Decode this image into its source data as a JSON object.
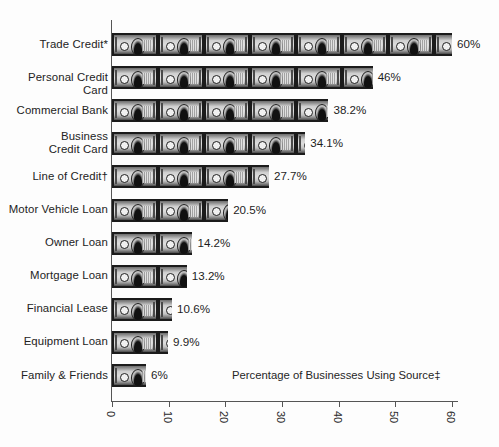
{
  "chart_data": {
    "type": "bar",
    "orientation": "horizontal",
    "title": "",
    "xlabel": "Percentage of Businesses Using Source‡",
    "ylabel": "",
    "xlim": [
      0,
      60
    ],
    "xticks": [
      "0",
      "10",
      "20",
      "30",
      "40",
      "50",
      "60"
    ],
    "grid": false,
    "legend": null,
    "pictogram_unit": "dollar-bill",
    "categories": [
      "Trade Credit*",
      "Personal Credit Card",
      "Commercial Bank",
      "Business\nCredit Card",
      "Line of Credit†",
      "Motor Vehicle Loan",
      "Owner Loan",
      "Mortgage Loan",
      "Financial Lease",
      "Equipment Loan",
      "Family & Friends"
    ],
    "values": [
      60,
      46,
      38.2,
      34.1,
      27.7,
      20.5,
      14.2,
      13.2,
      10.6,
      9.9,
      6
    ],
    "value_labels": [
      "60%",
      "46%",
      "38.2%",
      "34.1%",
      "27.7%",
      "20.5%",
      "14.2%",
      "13.2%",
      "10.6%",
      "9.9%",
      "6%"
    ]
  },
  "colors": {
    "background": "#fdfdfd",
    "axis": "#555555",
    "text": "#1d1d1d",
    "bar_dark": "#1b1b1b",
    "bar_light": "#dedede"
  }
}
